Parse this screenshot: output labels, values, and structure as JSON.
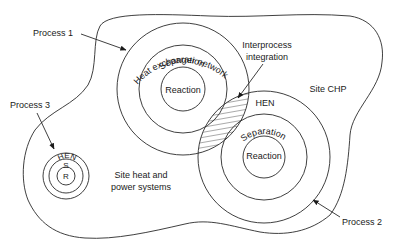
{
  "diagram": {
    "type": "nested-onion-site-integration",
    "site_boundary_label": "Site CHP",
    "site_systems_label": [
      "Site heat and",
      "power systems"
    ],
    "interprocess": {
      "label_lines": [
        "Interprocess",
        "integration"
      ]
    },
    "processes": [
      {
        "name": "Process 1",
        "rings": [
          "Heat exchanger network",
          "Separation",
          "Reaction"
        ]
      },
      {
        "name": "Process 2",
        "rings": [
          "HEN",
          "Separation",
          "Reaction"
        ]
      },
      {
        "name": "Process 3",
        "rings": [
          "HEN",
          "S",
          "R"
        ]
      }
    ],
    "colors": {
      "line": "#2a2a2a",
      "text": "#1a1a1a",
      "background": "#ffffff"
    }
  }
}
